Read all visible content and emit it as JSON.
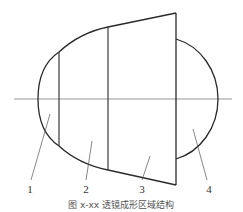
{
  "diagram": {
    "regions": [
      {
        "id": "1",
        "label": "1"
      },
      {
        "id": "2",
        "label": "2"
      },
      {
        "id": "3",
        "label": "3"
      },
      {
        "id": "4",
        "label": "4"
      }
    ],
    "caption": "图 x-xx  透镜成形区域结构",
    "colors": {
      "stroke": "#2a2a2a",
      "centerline": "#8a8a8a",
      "text": "#333333"
    }
  }
}
